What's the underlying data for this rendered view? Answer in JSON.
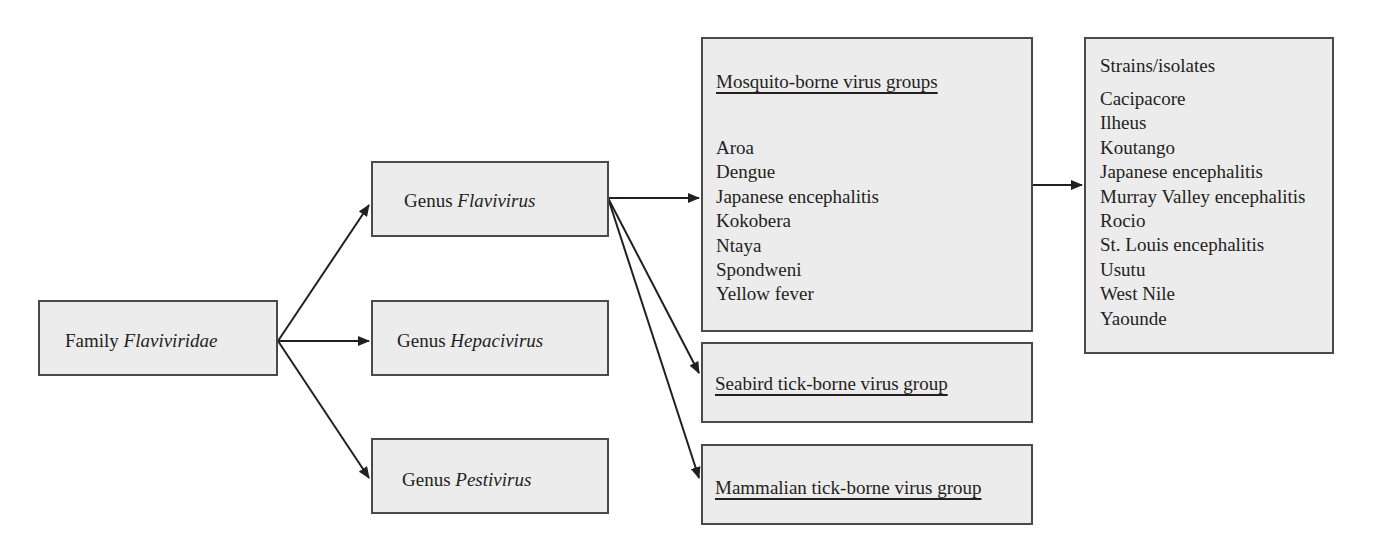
{
  "diagram": {
    "type": "taxonomy-tree",
    "colors": {
      "box_fill": "#ececec",
      "box_border": "#4a4a4a",
      "text": "#231f20",
      "arrow": "#231f20"
    },
    "family": {
      "prefix": "Family",
      "name": "Flaviviridae"
    },
    "genera": [
      {
        "prefix": "Genus",
        "name": "Flavivirus"
      },
      {
        "prefix": "Genus",
        "name": "Hepacivirus"
      },
      {
        "prefix": "Genus",
        "name": "Pestivirus"
      }
    ],
    "groups": {
      "mosquito": {
        "title": "Mosquito-borne virus groups",
        "items": [
          "Aroa",
          "Dengue",
          "Japanese encephalitis",
          "Kokobera",
          "Ntaya",
          "Spondweni",
          "Yellow fever"
        ]
      },
      "seabird": {
        "title": "Seabird tick-borne virus group"
      },
      "mammalian": {
        "title": "Mammalian tick-borne virus group"
      }
    },
    "strains": {
      "title": "Strains/isolates",
      "items": [
        "Cacipacore",
        "Ilheus",
        "Koutango",
        "Japanese encephalitis",
        "Murray Valley encephalitis",
        "Rocio",
        "St. Louis encephalitis",
        "Usutu",
        "West Nile",
        "Yaounde"
      ]
    },
    "edges": [
      {
        "from": "Family Flaviviridae",
        "to": "Genus Flavivirus"
      },
      {
        "from": "Family Flaviviridae",
        "to": "Genus Hepacivirus"
      },
      {
        "from": "Family Flaviviridae",
        "to": "Genus Pestivirus"
      },
      {
        "from": "Genus Flavivirus",
        "to": "Mosquito-borne virus groups"
      },
      {
        "from": "Genus Flavivirus",
        "to": "Seabird tick-borne virus group"
      },
      {
        "from": "Genus Flavivirus",
        "to": "Mammalian tick-borne virus group"
      },
      {
        "from": "Mosquito-borne virus groups",
        "to": "Strains/isolates"
      }
    ]
  }
}
